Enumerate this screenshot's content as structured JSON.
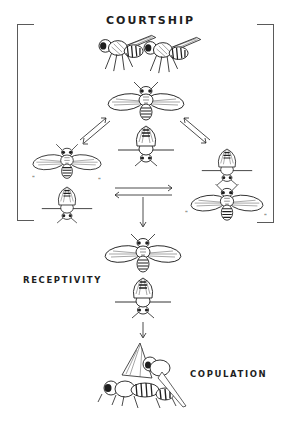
{
  "diagram": {
    "type": "flow",
    "style": "black-and-white pen illustration of Drosophila mating behavior",
    "stages": [
      {
        "id": "courtship",
        "label": "COURTSHIP"
      },
      {
        "id": "receptivity",
        "label": "RECEPTIVITY"
      },
      {
        "id": "copulation",
        "label": "COPULATION"
      }
    ],
    "courtship_group": {
      "bracketed": true,
      "nodes": [
        {
          "id": "side-view-pair",
          "description": "two flies side view, male orienting toward female"
        },
        {
          "id": "top-center",
          "description": "male with both wings extended behind female"
        },
        {
          "id": "left",
          "description": "male wing vibration behind female"
        },
        {
          "id": "right",
          "description": "male vibrating wings, female behind"
        }
      ],
      "edges": [
        {
          "from": "top-center",
          "to": "left",
          "type": "bidirectional"
        },
        {
          "from": "top-center",
          "to": "right",
          "type": "bidirectional"
        },
        {
          "from": "left",
          "to": "right",
          "type": "bidirectional"
        }
      ]
    },
    "edges": [
      {
        "from": "courtship",
        "to": "receptivity",
        "type": "arrow-down"
      },
      {
        "from": "receptivity",
        "to": "copulation",
        "type": "arrow-down"
      }
    ],
    "colors": {
      "ink": "#1e1e1e",
      "bracket": "#5a5a5a",
      "background": "#ffffff"
    }
  }
}
